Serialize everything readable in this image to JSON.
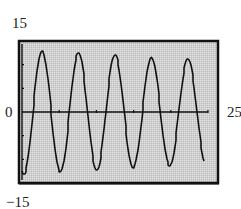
{
  "chart_data": {
    "type": "line",
    "title": "",
    "xlabel": "",
    "ylabel": "",
    "xlim": [
      0,
      25
    ],
    "ylim": [
      -15,
      15
    ],
    "grid": false,
    "legend": null,
    "tick_labels": {
      "ymax": "15",
      "ymin": "−15",
      "xmin": "0",
      "xmax": "25"
    },
    "series": [
      {
        "name": "y",
        "description": "Slowly damped sinusoidal oscillation, period about 4.9, amplitude decreasing from about 13 to about 11",
        "x": [
          0,
          0.4,
          1.6,
          2.7,
          3.9,
          5.2,
          6.4,
          7.6,
          8.8,
          10.1,
          11.3,
          12.5,
          13.7,
          15.0,
          16.2,
          17.4,
          18.6,
          19.9,
          21.1,
          22.3,
          23.5,
          24.6
        ],
        "y": [
          -9,
          -13,
          0,
          13,
          0,
          -12.5,
          0,
          12.5,
          0,
          -12,
          0,
          12,
          0,
          -11.5,
          0,
          11.5,
          0,
          -11,
          0,
          11,
          0,
          -9.5
        ]
      }
    ],
    "x_ticks_count": 5,
    "y_ticks_count": 6,
    "background": "#d4d4d4",
    "frame_color": "#111111",
    "line_color": "#111111"
  }
}
